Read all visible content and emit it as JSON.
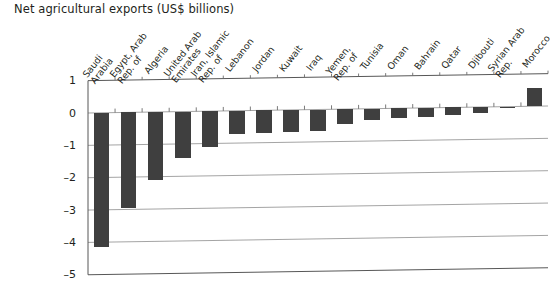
{
  "chart_data": {
    "type": "bar",
    "title": "Net agricultural exports (US$ billions)",
    "xlabel": "",
    "ylabel": "",
    "ylim": [
      -5,
      1
    ],
    "yticks": [
      1,
      0,
      -1,
      -2,
      -3,
      -4,
      -5
    ],
    "ytick_labels": [
      "1",
      "0",
      "–1",
      "–2",
      "–3",
      "–4",
      "–5"
    ],
    "grid": true,
    "grid_axis": "y",
    "legend": false,
    "bar_color": "#3f3f3f",
    "categories": [
      "Saudi\nArabia",
      "Egypt, Arab\nRep. of",
      "Algeria",
      "United Arab\nEmirates",
      "Iran, Islamic\nRep. of",
      "Lebanon",
      "Jordan",
      "Kuwait",
      "Iraq",
      "Yemen,\nRep. of",
      "Tunisia",
      "Oman",
      "Bahrain",
      "Qatar",
      "Djibouti",
      "Syrian Arab\nRep.",
      "Morocco"
    ],
    "values": [
      -4.15,
      -2.95,
      -2.1,
      -1.45,
      -1.1,
      -0.72,
      -0.7,
      -0.68,
      -0.66,
      -0.45,
      -0.35,
      -0.3,
      -0.27,
      -0.23,
      -0.18,
      -0.05,
      0.55
    ]
  }
}
